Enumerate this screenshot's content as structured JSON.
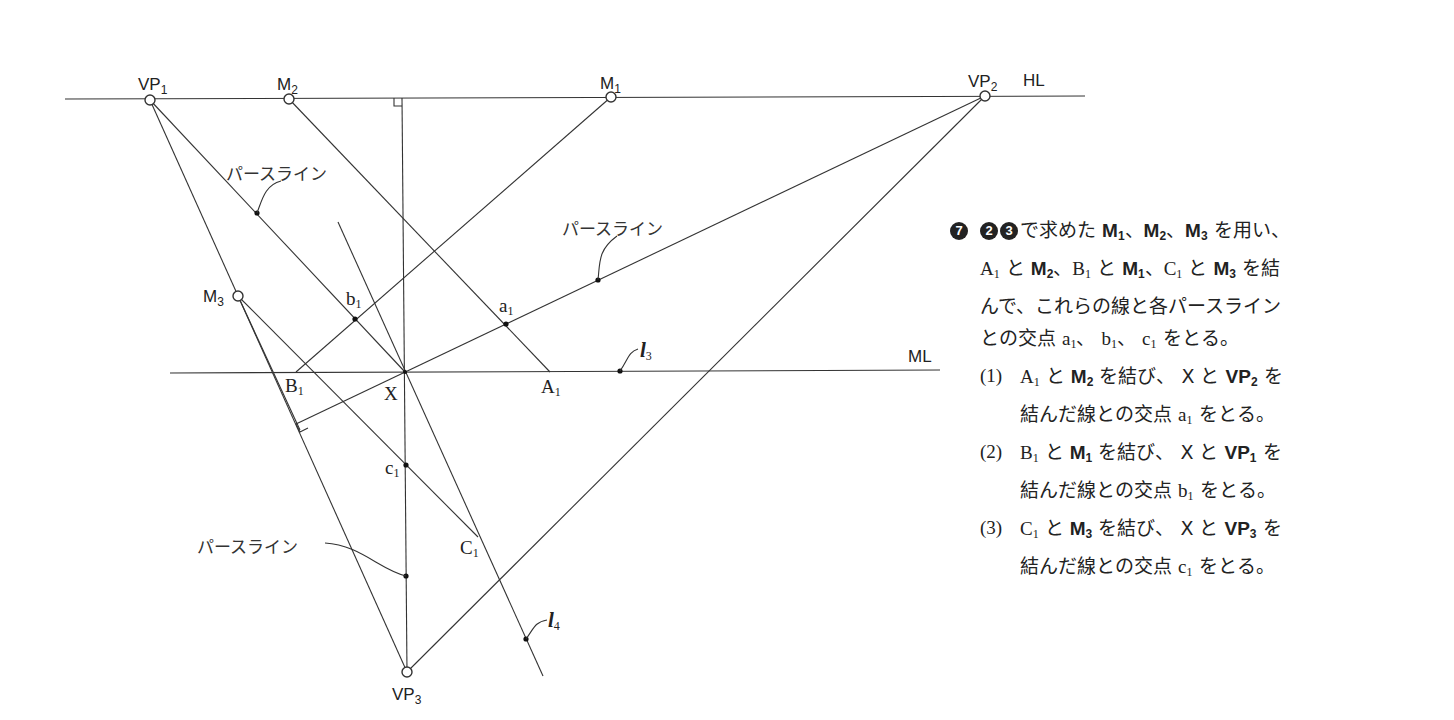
{
  "diagram": {
    "labels": {
      "vp1": "VP",
      "vp1_sub": "1",
      "vp2": "VP",
      "vp2_sub": "2",
      "vp3": "VP",
      "vp3_sub": "3",
      "m1": "M",
      "m1_sub": "1",
      "m2": "M",
      "m2_sub": "2",
      "m3": "M",
      "m3_sub": "3",
      "hl": "HL",
      "ml": "ML",
      "x": "X",
      "a1": "a",
      "a1_sub": "1",
      "b1": "b",
      "b1_sub": "1",
      "c1": "c",
      "c1_sub": "1",
      "A1": "A",
      "A1_sub": "1",
      "B1": "B",
      "B1_sub": "1",
      "C1": "C",
      "C1_sub": "1",
      "l3": "l",
      "l3_sub": "3",
      "l4": "l",
      "l4_sub": "4",
      "perspective_line_1": "パースライン",
      "perspective_line_2": "パースライン",
      "perspective_line_3": "パースライン"
    }
  },
  "instructions": {
    "step_number": "7",
    "ref_1": "2",
    "ref_2": "3",
    "intro_1": "で求めた",
    "intro_m1": "M",
    "intro_m1_sub": "1",
    "sep1": "、",
    "intro_m2": "M",
    "intro_m2_sub": "2",
    "sep2": "、",
    "intro_m3": "M",
    "intro_m3_sub": "3",
    "intro_2": " を用い、",
    "line2_a": "A",
    "line2_a_sub": "1",
    "line2_t1": " と ",
    "line2_m2": "M",
    "line2_m2_sub": "2",
    "line2_t2": "、",
    "line2_b": "B",
    "line2_b_sub": "1",
    "line2_t3": " と ",
    "line2_m1": "M",
    "line2_m1_sub": "1",
    "line2_t4": "、",
    "line2_c": "C",
    "line2_c_sub": "1",
    "line2_t5": " と ",
    "line2_m3": "M",
    "line2_m3_sub": "3",
    "line2_t6": " を結",
    "line3": "んで、これらの線と各パースライン",
    "line4_t1": "との交点 ",
    "line4_a": "a",
    "line4_a_sub": "1",
    "line4_t2": "、 ",
    "line4_b": "b",
    "line4_b_sub": "1",
    "line4_t3": "、 ",
    "line4_c": "c",
    "line4_c_sub": "1",
    "line4_t4": " をとる。",
    "items": [
      {
        "num": "(1)",
        "p1": "A",
        "p1_sub": "1",
        "t1": " と ",
        "m": "M",
        "m_sub": "2",
        "t2": " を結び、 X と ",
        "vp": "VP",
        "vp_sub": "2",
        "t3": " を",
        "l2a": "結んだ線との交点 ",
        "pt": "a",
        "pt_sub": "1",
        "l2b": " をとる。"
      },
      {
        "num": "(2)",
        "p1": "B",
        "p1_sub": "1",
        "t1": " と ",
        "m": "M",
        "m_sub": "1",
        "t2": " を結び、 X と ",
        "vp": "VP",
        "vp_sub": "1",
        "t3": " を",
        "l2a": "結んだ線との交点 ",
        "pt": "b",
        "pt_sub": "1",
        "l2b": " をとる。"
      },
      {
        "num": "(3)",
        "p1": "C",
        "p1_sub": "1",
        "t1": " と ",
        "m": "M",
        "m_sub": "3",
        "t2": " を結び、 X と ",
        "vp": "VP",
        "vp_sub": "3",
        "t3": " を",
        "l2a": "結んだ線との交点 ",
        "pt": "c",
        "pt_sub": "1",
        "l2b": " をとる。"
      }
    ]
  }
}
